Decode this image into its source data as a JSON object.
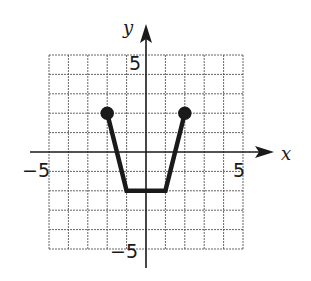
{
  "chart_data": {
    "type": "line",
    "title": "",
    "xlabel": "x",
    "ylabel": "y",
    "xlim": [
      -5,
      5
    ],
    "ylim": [
      -5,
      5
    ],
    "grid": true,
    "grid_step": 1,
    "tick_labels": {
      "x": [
        {
          "value": -5,
          "label": "−5"
        },
        {
          "value": 5,
          "label": "5"
        }
      ],
      "y": [
        {
          "value": 5,
          "label": "5"
        },
        {
          "value": -5,
          "label": "−5"
        }
      ]
    },
    "series": [
      {
        "name": "graph",
        "points": [
          [
            -2,
            2
          ],
          [
            -1,
            -2
          ],
          [
            1,
            -2
          ],
          [
            2,
            2
          ]
        ],
        "endpoints": [
          {
            "x": -2,
            "y": 2,
            "style": "closed-dot"
          },
          {
            "x": 2,
            "y": 2,
            "style": "closed-dot"
          }
        ]
      }
    ],
    "legend": null
  },
  "labels": {
    "x_axis": "x",
    "y_axis": "y",
    "x_neg": "−5",
    "x_pos": "5",
    "y_pos": "5",
    "y_neg": "−5"
  },
  "colors": {
    "line": "#1a1a1a",
    "grid": "#555555",
    "axis": "#1a1a1a",
    "background": "#ffffff"
  }
}
